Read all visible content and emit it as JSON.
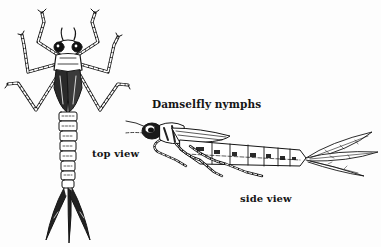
{
  "figure": {
    "title": "Damselfly nymphs",
    "labels": {
      "top_view": "top view",
      "side_view": "side view"
    },
    "illustrations": [
      {
        "name": "top-view-nymph",
        "description": "Damselfly nymph seen from above with six legs and three caudal gills"
      },
      {
        "name": "side-view-nymph",
        "description": "Damselfly nymph seen from the side with three leaf-like caudal gills"
      }
    ],
    "colors": {
      "ink": "#151515",
      "background": "#fdfdfd"
    }
  }
}
